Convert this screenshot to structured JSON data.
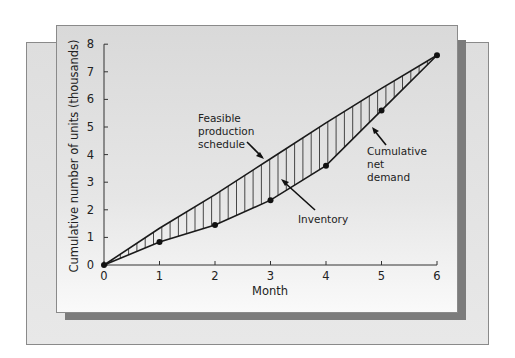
{
  "chart_data": {
    "type": "line",
    "title": "",
    "xlabel": "Month",
    "ylabel": "Cumulative number of units (thousands)",
    "x": [
      0,
      1,
      2,
      3,
      4,
      5,
      6
    ],
    "xticks": [
      "0",
      "1",
      "2",
      "3",
      "4",
      "5",
      "6"
    ],
    "yticks": [
      "0",
      "1",
      "2",
      "3",
      "4",
      "5",
      "6",
      "7",
      "8"
    ],
    "xlim": [
      0,
      6
    ],
    "ylim": [
      0,
      8
    ],
    "grid": false,
    "legend": "none (inline annotations)",
    "series": [
      {
        "name": "Feasible production schedule",
        "values": [
          0,
          1.33,
          2.55,
          3.85,
          5.15,
          6.4,
          7.6
        ],
        "markers": false
      },
      {
        "name": "Cumulative net demand",
        "values": [
          0,
          0.83,
          1.45,
          2.35,
          3.6,
          5.6,
          7.6
        ],
        "markers": true
      }
    ],
    "shaded_region": {
      "name": "Inventory",
      "between": [
        "Feasible production schedule",
        "Cumulative net demand"
      ],
      "pattern": "vertical hatch"
    },
    "annotations": [
      {
        "text": [
          "Feasible",
          "production",
          "schedule"
        ],
        "points_to": "Feasible production schedule"
      },
      {
        "text": [
          "Inventory"
        ],
        "points_to": "shaded region"
      },
      {
        "text": [
          "Cumulative",
          "net",
          "demand"
        ],
        "points_to": "Cumulative net demand"
      }
    ]
  },
  "labels": {
    "xlabel": "Month",
    "ylabel": "Cumulative number of units (thousands)",
    "feasible_1": "Feasible",
    "feasible_2": "production",
    "feasible_3": "schedule",
    "inventory": "Inventory",
    "demand_1": "Cumulative",
    "demand_2": "net",
    "demand_3": "demand"
  },
  "colors": {
    "line": "#1a1a1a",
    "hatch": "#333333",
    "panel": "#d9d9d9",
    "shadow": "#7c7c7c",
    "back_panel": "#e2e2e2"
  }
}
